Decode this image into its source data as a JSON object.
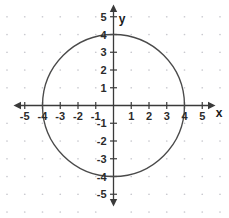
{
  "chart_data": {
    "type": "scatter",
    "title": "",
    "subtitle": "",
    "xlabel": "x",
    "ylabel": "y",
    "xlim": [
      -5.6,
      5.6
    ],
    "ylim": [
      -5.6,
      5.6
    ],
    "grid": true,
    "grid_style": "dotted-lattice",
    "legend": null,
    "x_ticks": [
      -5,
      -4,
      -3,
      -2,
      -1,
      1,
      2,
      3,
      4,
      5
    ],
    "y_ticks": [
      -5,
      -4,
      -3,
      -2,
      -1,
      1,
      2,
      3,
      4,
      5
    ],
    "x_tick_labels": [
      "-5",
      "-4",
      "-3",
      "-2",
      "-1",
      "1",
      "2",
      "3",
      "4",
      "5"
    ],
    "y_tick_labels": [
      "-5",
      "-4",
      "-3",
      "-2",
      "-1",
      "1",
      "2",
      "3",
      "4",
      "5"
    ],
    "shapes": [
      {
        "kind": "circle",
        "center": [
          0,
          0
        ],
        "radius": 4,
        "equation": "x^2 + y^2 = 16",
        "stroke": "#4a4a4a",
        "fill": "none",
        "intercepts": [
          [
            -4,
            0
          ],
          [
            4,
            0
          ],
          [
            0,
            4
          ],
          [
            0,
            -4
          ]
        ]
      }
    ],
    "annotations": [],
    "colors": {
      "background": "#ffffff",
      "axis": "#3a3a3a",
      "grid_dot": "#c9c9cf",
      "curve": "#4a4a4a",
      "label": "#2b2b2b"
    }
  },
  "axes": {
    "x_axis_name": "x",
    "y_axis_name": "y"
  }
}
